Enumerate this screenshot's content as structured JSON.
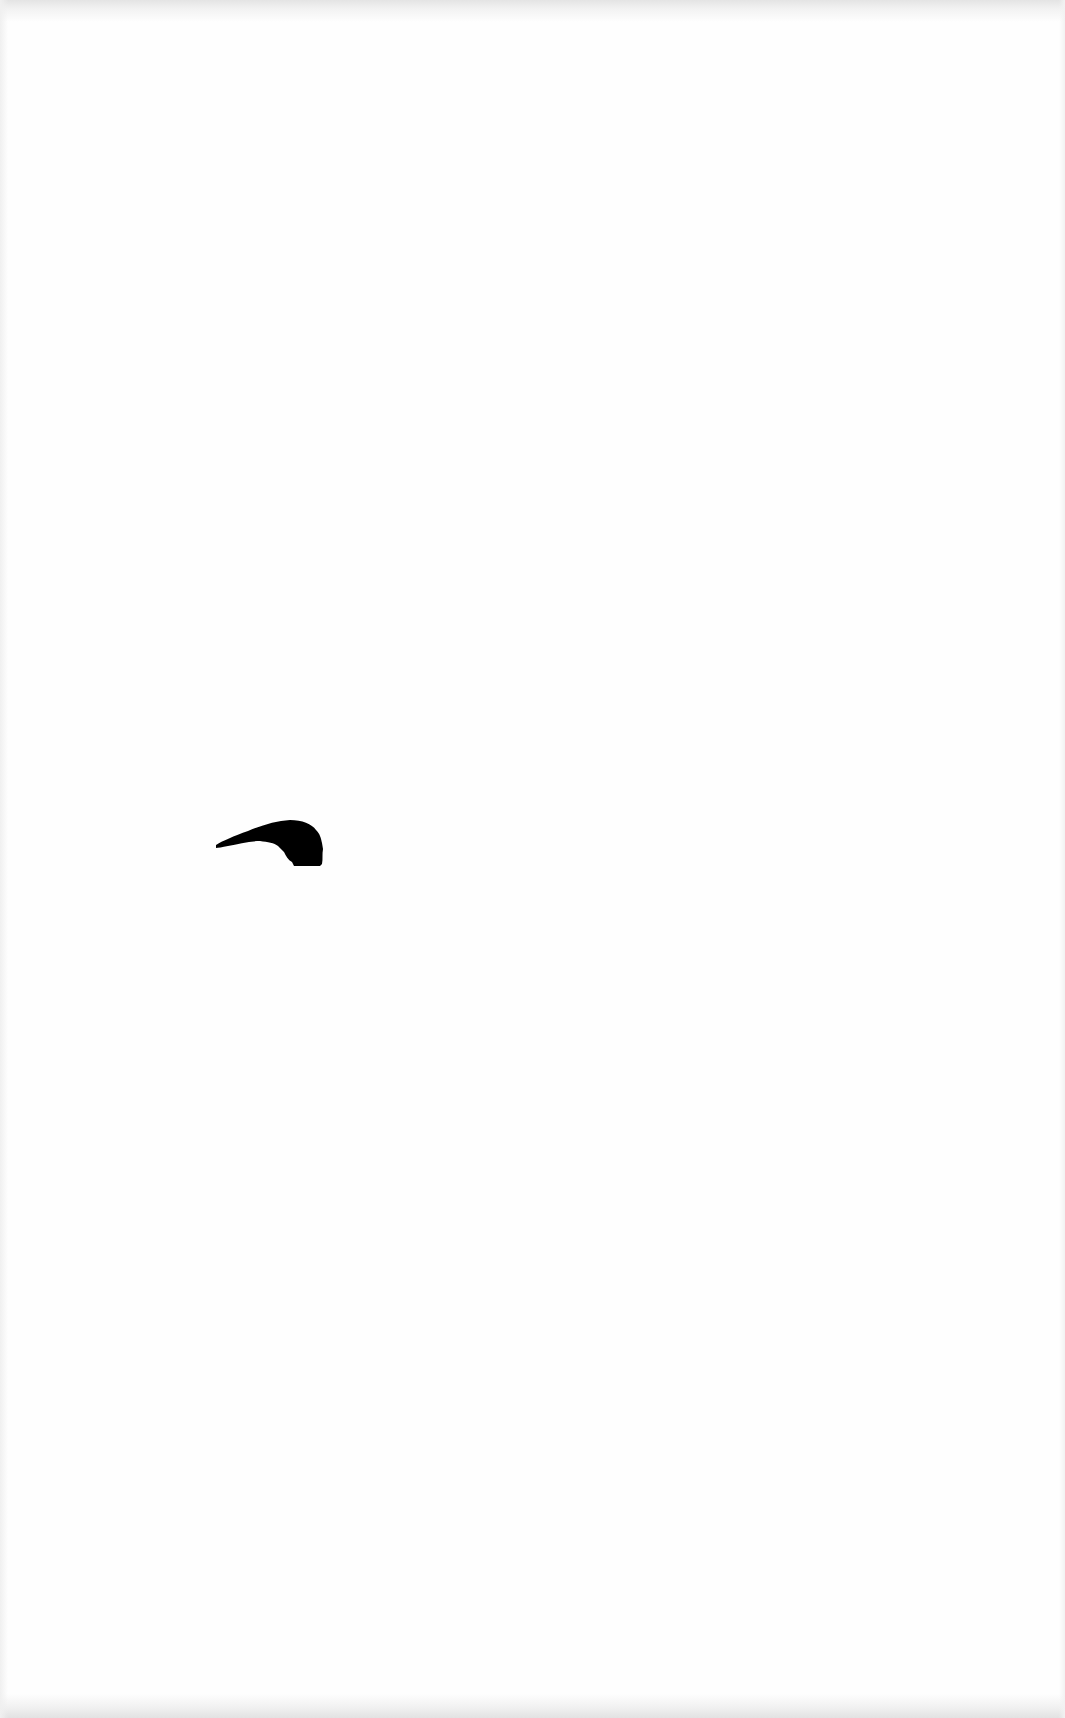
{
  "page": {
    "type": "scanned-blank-page",
    "background_color": "#fefefe",
    "edge_noise_color": "#e4e4e4"
  },
  "marks": [
    {
      "kind": "ink-blot",
      "shape": "curved-hook",
      "color": "#000000",
      "bbox": {
        "x": 216,
        "y": 820,
        "width": 107,
        "height": 46
      }
    }
  ],
  "text": ""
}
